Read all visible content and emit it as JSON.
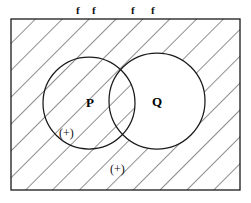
{
  "figure": {
    "title": "",
    "canvas": {
      "width": 251,
      "height": 203,
      "background": "#ffffff"
    },
    "universe_rect": {
      "name": "universe-rectangle",
      "x": 11,
      "y": 19,
      "width": 229,
      "height": 171,
      "stroke": "#1a1a1a",
      "fill": "#ffffff"
    },
    "hatching": {
      "direction": "top-left-to-bottom-right",
      "spacing_px": 19,
      "stroke": "#3a3a3a",
      "stroke_width": 1.1,
      "description": "diagonal hatch fills the universe rectangle everywhere except the part of circle Q that lies outside circle P"
    },
    "circles": [
      {
        "name": "circle-p",
        "label": "P",
        "cx": 89,
        "cy": 103,
        "r": 46,
        "stroke": "#1a1a1a",
        "hatched": true
      },
      {
        "name": "circle-q",
        "label": "Q",
        "cx": 157,
        "cy": 101,
        "r": 48,
        "stroke": "#1a1a1a",
        "hatched": false
      }
    ],
    "set_labels": [
      {
        "name": "label-p",
        "text": "P",
        "x": 86,
        "y": 96
      },
      {
        "name": "label-q",
        "text": "Q",
        "x": 152,
        "y": 95
      }
    ],
    "f_labels": [
      {
        "name": "f-label-1",
        "text": "f",
        "x": 76,
        "y": 5
      },
      {
        "name": "f-label-2",
        "text": "f",
        "x": 92,
        "y": 5
      },
      {
        "name": "f-label-3",
        "text": "f",
        "x": 131,
        "y": 5
      },
      {
        "name": "f-label-4",
        "text": "f",
        "x": 151,
        "y": 5
      }
    ],
    "plus_labels": [
      {
        "name": "plus-label-inside-p",
        "text": "(+)",
        "x": 59,
        "y": 127
      },
      {
        "name": "plus-label-outside",
        "text": "(+)",
        "x": 110,
        "y": 163
      }
    ]
  }
}
